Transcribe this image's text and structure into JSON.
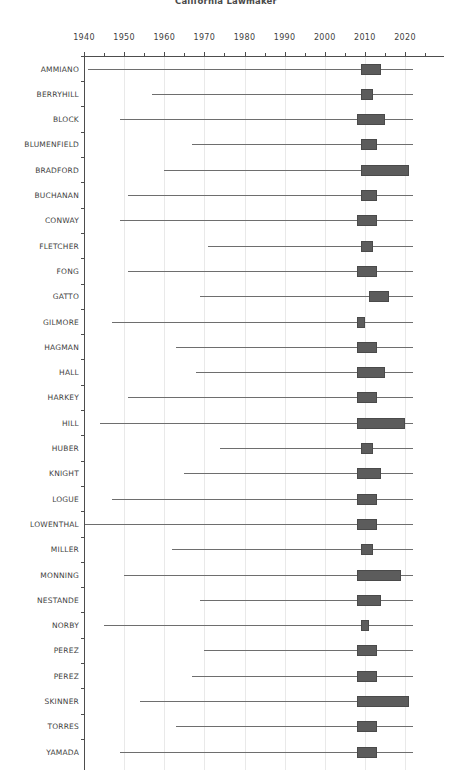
{
  "chart_data": {
    "type": "bar",
    "title": "California Lawmaker",
    "xlabel": "",
    "ylabel": "",
    "xlim": [
      1935,
      2026
    ],
    "xticks": [
      1940,
      1950,
      1960,
      1970,
      1980,
      1990,
      2000,
      2010,
      2020
    ],
    "xtick_labels": [
      "1940",
      "1950",
      "1960",
      "1970",
      "1980",
      "1990",
      "2000",
      "2010",
      "2020"
    ],
    "minor_tick_interval": 5,
    "grid": true,
    "grid_axis": "x",
    "legend": "none",
    "axis_position": "top",
    "orientation": "horizontal",
    "categories": [
      "AMMIANO",
      "BERRYHILL",
      "BLOCK",
      "BLUMENFIELD",
      "BRADFORD",
      "BUCHANAN",
      "CONWAY",
      "FLETCHER",
      "FONG",
      "GATTO",
      "GILMORE",
      "HAGMAN",
      "HALL",
      "HARKEY",
      "HILL",
      "HUBER",
      "KNIGHT",
      "LOGUE",
      "LOWENTHAL",
      "MILLER",
      "MONNING",
      "NESTANDE",
      "NORBY",
      "PEREZ",
      "PEREZ",
      "SKINNER",
      "TORRES",
      "YAMADA"
    ],
    "series": [
      {
        "category": "AMMIANO",
        "whisker_low": 1941,
        "box_low": 2009,
        "box_high": 2014,
        "whisker_high": 2022
      },
      {
        "category": "BERRYHILL",
        "whisker_low": 1957,
        "box_low": 2009,
        "box_high": 2012,
        "whisker_high": 2022
      },
      {
        "category": "BLOCK",
        "whisker_low": 1949,
        "box_low": 2008,
        "box_high": 2015,
        "whisker_high": 2022
      },
      {
        "category": "BLUMENFIELD",
        "whisker_low": 1967,
        "box_low": 2009,
        "box_high": 2013,
        "whisker_high": 2022
      },
      {
        "category": "BRADFORD",
        "whisker_low": 1960,
        "box_low": 2009,
        "box_high": 2021,
        "whisker_high": 2021
      },
      {
        "category": "BUCHANAN",
        "whisker_low": 1951,
        "box_low": 2009,
        "box_high": 2013,
        "whisker_high": 2022
      },
      {
        "category": "CONWAY",
        "whisker_low": 1949,
        "box_low": 2008,
        "box_high": 2013,
        "whisker_high": 2022
      },
      {
        "category": "FLETCHER",
        "whisker_low": 1971,
        "box_low": 2009,
        "box_high": 2012,
        "whisker_high": 2022
      },
      {
        "category": "FONG",
        "whisker_low": 1951,
        "box_low": 2008,
        "box_high": 2013,
        "whisker_high": 2022
      },
      {
        "category": "GATTO",
        "whisker_low": 1969,
        "box_low": 2011,
        "box_high": 2016,
        "whisker_high": 2022
      },
      {
        "category": "GILMORE",
        "whisker_low": 1947,
        "box_low": 2008,
        "box_high": 2010,
        "whisker_high": 2022
      },
      {
        "category": "HAGMAN",
        "whisker_low": 1963,
        "box_low": 2008,
        "box_high": 2013,
        "whisker_high": 2022
      },
      {
        "category": "HALL",
        "whisker_low": 1968,
        "box_low": 2008,
        "box_high": 2015,
        "whisker_high": 2022
      },
      {
        "category": "HARKEY",
        "whisker_low": 1951,
        "box_low": 2008,
        "box_high": 2013,
        "whisker_high": 2022
      },
      {
        "category": "HILL",
        "whisker_low": 1944,
        "box_low": 2008,
        "box_high": 2020,
        "whisker_high": 2022
      },
      {
        "category": "HUBER",
        "whisker_low": 1974,
        "box_low": 2009,
        "box_high": 2012,
        "whisker_high": 2022
      },
      {
        "category": "KNIGHT",
        "whisker_low": 1965,
        "box_low": 2008,
        "box_high": 2014,
        "whisker_high": 2022
      },
      {
        "category": "LOGUE",
        "whisker_low": 1947,
        "box_low": 2008,
        "box_high": 2013,
        "whisker_high": 2022
      },
      {
        "category": "LOWENTHAL",
        "whisker_low": 1936,
        "box_low": 2008,
        "box_high": 2013,
        "whisker_high": 2022
      },
      {
        "category": "MILLER",
        "whisker_low": 1962,
        "box_low": 2009,
        "box_high": 2012,
        "whisker_high": 2022
      },
      {
        "category": "MONNING",
        "whisker_low": 1950,
        "box_low": 2008,
        "box_high": 2019,
        "whisker_high": 2022
      },
      {
        "category": "NESTANDE",
        "whisker_low": 1969,
        "box_low": 2008,
        "box_high": 2014,
        "whisker_high": 2022
      },
      {
        "category": "NORBY",
        "whisker_low": 1945,
        "box_low": 2009,
        "box_high": 2011,
        "whisker_high": 2022
      },
      {
        "category": "PEREZ",
        "whisker_low": 1970,
        "box_low": 2008,
        "box_high": 2013,
        "whisker_high": 2022
      },
      {
        "category": "PEREZ",
        "whisker_low": 1967,
        "box_low": 2008,
        "box_high": 2013,
        "whisker_high": 2022
      },
      {
        "category": "SKINNER",
        "whisker_low": 1954,
        "box_low": 2008,
        "box_high": 2021,
        "whisker_high": 2021
      },
      {
        "category": "TORRES",
        "whisker_low": 1963,
        "box_low": 2008,
        "box_high": 2013,
        "whisker_high": 2022
      },
      {
        "category": "YAMADA",
        "whisker_low": 1949,
        "box_low": 2008,
        "box_high": 2013,
        "whisker_high": 2022
      }
    ],
    "colors": {
      "box_fill": "#5c5c5c",
      "box_edge": "#4a4a4a",
      "whisker": "#6e6e6e",
      "axis": "#4d4d4d",
      "grid": "#e9e9e9",
      "text": "#3f3f3f",
      "background": "#ffffff"
    }
  }
}
